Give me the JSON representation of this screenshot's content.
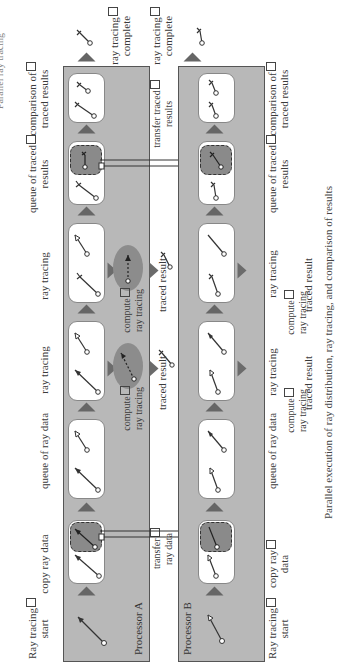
{
  "heading": "Parallel ray tracing",
  "caption": "Parallel execution of ray distribution, ray tracing, and comparison of results",
  "processors": [
    {
      "name": "Processor A",
      "labels_top": {
        "start": [
          "Ray tracing",
          "start"
        ],
        "copy": "copy ray data",
        "queue": "queue of ray data",
        "trace1": "ray tracing",
        "trace2": "ray tracing",
        "queue_results": [
          "queue of traced",
          "results"
        ],
        "compare": [
          "comparison of",
          "traced results"
        ],
        "complete": [
          "ray tracing",
          "complete"
        ]
      },
      "compute_labels": [
        [
          "compute",
          "ray tracing"
        ],
        [
          "compute",
          "ray tracing"
        ]
      ],
      "traced_results": [
        "traced result",
        "traced result"
      ]
    },
    {
      "name": "Processor B",
      "labels_bottom": {
        "start": [
          "Ray tracing",
          "start"
        ],
        "copy": [
          "copy ray",
          "data"
        ],
        "queue": "queue of ray data",
        "queue_results": [
          "queue of traced",
          "results"
        ],
        "compare": [
          "comparison of",
          "traced results"
        ]
      },
      "labels_top": {
        "trace1": "ray tracing",
        "trace2": "ray tracing",
        "complete": [
          "ray tracing",
          "complete"
        ]
      },
      "compute_labels": [
        [
          "compute",
          "ray tracing"
        ],
        [
          "compute",
          "ray tracing"
        ]
      ],
      "traced_results": [
        "traced result",
        "traced result"
      ]
    }
  ],
  "transfers": {
    "ray_data": [
      "transfer",
      "ray data"
    ],
    "traced_results": [
      "transfer traced",
      "results"
    ]
  },
  "colors": {
    "panel": "#b8b8b8",
    "queue": "#8a8a8a",
    "oval": "#8c8c8c",
    "card": "#ffffff",
    "line": "#333333"
  }
}
